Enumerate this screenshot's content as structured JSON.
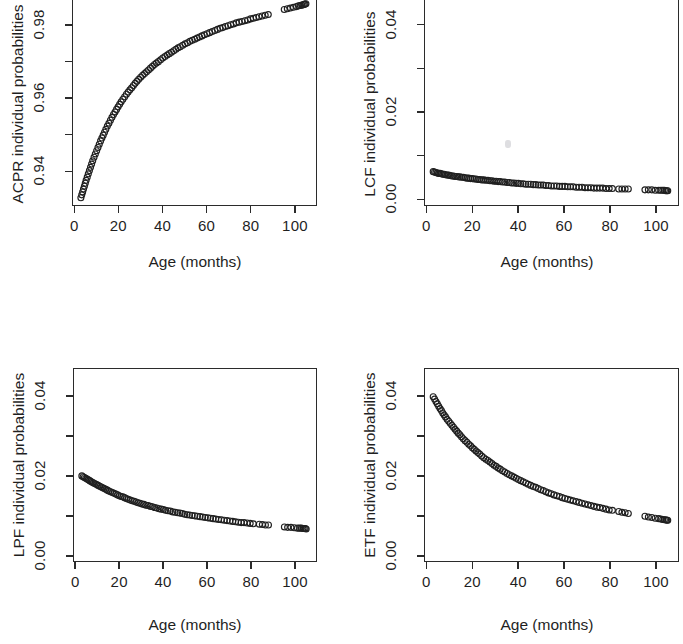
{
  "figure": {
    "layout": "2x2 grid of scatter plots",
    "background": "#ffffff",
    "marker_color": "#202020",
    "axis_color": "#2b2b2b"
  },
  "panels": [
    {
      "id": "acpr",
      "ylabel": "ACPR individual probabilities",
      "xlabel": "Age (months)",
      "ytick_labels": [
        "0.94",
        "0.96",
        "0.98"
      ],
      "xtick_labels": [
        "0",
        "20",
        "40",
        "60",
        "80",
        "100"
      ]
    },
    {
      "id": "lcf",
      "ylabel": "LCF individual probabilities",
      "xlabel": "Age (months)",
      "ytick_labels": [
        "0.00",
        "0.02",
        "0.04"
      ],
      "xtick_labels": [
        "0",
        "20",
        "40",
        "60",
        "80",
        "100"
      ]
    },
    {
      "id": "lpf",
      "ylabel": "LPF individual probabilities",
      "xlabel": "Age (months)",
      "ytick_labels": [
        "0.00",
        "0.02",
        "0.04"
      ],
      "xtick_labels": [
        "0",
        "20",
        "40",
        "60",
        "80",
        "100"
      ]
    },
    {
      "id": "etf",
      "ylabel": "ETF individual probabilities",
      "xlabel": "Age (months)",
      "ytick_labels": [
        "0.00",
        "0.02",
        "0.04"
      ],
      "xtick_labels": [
        "0",
        "20",
        "40",
        "60",
        "80",
        "100"
      ]
    }
  ],
  "chart_data": [
    {
      "type": "scatter",
      "title": "",
      "xlabel": "Age (months)",
      "ylabel": "ACPR individual probabilities",
      "xlim": [
        -1,
        110
      ],
      "ylim": [
        0.9305,
        0.9885
      ],
      "xticks": [
        0,
        20,
        40,
        60,
        80,
        100
      ],
      "yticks": [
        0.94,
        0.96,
        0.98
      ],
      "yticks_minor": [
        0.93,
        0.95,
        0.97,
        0.98
      ],
      "grid": false,
      "legend": false,
      "marker": "open-circle",
      "x": [
        2.6,
        3.0,
        3.4,
        3.8,
        4.2,
        4.6,
        5.0,
        5.5,
        6.0,
        6.5,
        7.0,
        7.5,
        8.0,
        8.6,
        9.2,
        9.8,
        10.4,
        11.0,
        11.6,
        12.2,
        12.8,
        13.4,
        14.0,
        14.7,
        15.4,
        16.1,
        16.8,
        17.5,
        18.2,
        18.9,
        19.6,
        20.3,
        21.0,
        21.8,
        22.6,
        23.4,
        24.2,
        25.0,
        25.8,
        26.6,
        27.4,
        28.2,
        29.0,
        29.9,
        30.8,
        31.7,
        32.6,
        33.5,
        34.4,
        35.3,
        36.2,
        37.1,
        38.0,
        39.0,
        40.0,
        41.0,
        42.0,
        43.0,
        44.0,
        45.0,
        46.0,
        47.0,
        48.0,
        49.1,
        50.2,
        51.3,
        52.4,
        53.5,
        54.6,
        55.7,
        56.8,
        57.9,
        59.0,
        60.2,
        61.4,
        62.6,
        63.8,
        65.0,
        66.2,
        67.4,
        68.6,
        69.8,
        71.0,
        72.3,
        73.6,
        74.9,
        76.2,
        77.5,
        78.8,
        80.1,
        81.4,
        82.7,
        84.0,
        85.4,
        86.8,
        88.2,
        95.5,
        96.9,
        98.3,
        99.7,
        101.1,
        102.0,
        102.8,
        103.5,
        104.1,
        104.6,
        105.0,
        105.4
      ],
      "y": [
        0.9325,
        0.9333,
        0.9341,
        0.9349,
        0.9357,
        0.9365,
        0.9373,
        0.9382,
        0.9391,
        0.94,
        0.9409,
        0.9418,
        0.9427,
        0.9437,
        0.9446,
        0.9455,
        0.9464,
        0.9473,
        0.9482,
        0.949,
        0.9498,
        0.9506,
        0.9514,
        0.9523,
        0.9531,
        0.9539,
        0.9547,
        0.9555,
        0.9562,
        0.9569,
        0.9576,
        0.9583,
        0.959,
        0.9597,
        0.9604,
        0.9611,
        0.9617,
        0.9623,
        0.9629,
        0.9635,
        0.9641,
        0.9647,
        0.9652,
        0.9658,
        0.9663,
        0.9668,
        0.9673,
        0.9678,
        0.9683,
        0.9688,
        0.9693,
        0.9697,
        0.9701,
        0.9706,
        0.9711,
        0.9715,
        0.9719,
        0.9723,
        0.9727,
        0.9731,
        0.9735,
        0.9739,
        0.9742,
        0.9746,
        0.975,
        0.9753,
        0.9757,
        0.976,
        0.9763,
        0.9766,
        0.9769,
        0.9772,
        0.9775,
        0.9778,
        0.9781,
        0.9784,
        0.9787,
        0.979,
        0.9793,
        0.9795,
        0.9798,
        0.98,
        0.9803,
        0.9805,
        0.9808,
        0.981,
        0.9812,
        0.9814,
        0.9816,
        0.9819,
        0.9821,
        0.9823,
        0.9825,
        0.9827,
        0.9829,
        0.9831,
        0.9845,
        0.9847,
        0.9849,
        0.9851,
        0.9853,
        0.9855,
        0.9856,
        0.9857,
        0.9858,
        0.9859,
        0.986,
        0.9861
      ]
    },
    {
      "type": "scatter",
      "title": "",
      "xlabel": "Age (months)",
      "ylabel": "LCF individual probabilities",
      "xlim": [
        -1,
        110
      ],
      "ylim": [
        -0.0015,
        0.047
      ],
      "xticks": [
        0,
        20,
        40,
        60,
        80,
        100
      ],
      "yticks": [
        0.0,
        0.02,
        0.04
      ],
      "yticks_minor": [
        0.01,
        0.03
      ],
      "grid": false,
      "legend": false,
      "marker": "open-circle",
      "x": [
        2.6,
        3.2,
        3.8,
        4.4,
        5.0,
        5.6,
        6.2,
        6.8,
        7.4,
        8.0,
        8.7,
        9.4,
        10.1,
        10.8,
        11.5,
        12.2,
        12.9,
        13.6,
        14.3,
        15.0,
        15.8,
        16.6,
        17.4,
        18.2,
        19.0,
        19.8,
        20.6,
        21.4,
        22.2,
        23.0,
        23.9,
        24.8,
        25.7,
        26.6,
        27.5,
        28.4,
        29.3,
        30.2,
        31.1,
        32.0,
        33.0,
        34.0,
        35.0,
        36.0,
        37.0,
        38.0,
        39.0,
        40.0,
        41.0,
        42.1,
        43.2,
        44.3,
        45.4,
        46.5,
        47.6,
        48.7,
        49.8,
        50.9,
        52.0,
        53.2,
        54.4,
        55.6,
        56.8,
        58.0,
        59.2,
        60.4,
        61.6,
        62.8,
        64.0,
        65.3,
        66.6,
        67.9,
        69.2,
        70.5,
        71.8,
        73.1,
        74.4,
        75.7,
        77.0,
        78.4,
        79.8,
        81.2,
        84.0,
        85.4,
        86.8,
        88.2,
        95.5,
        97.0,
        98.5,
        100.0,
        101.5,
        102.5,
        103.3,
        104.0,
        104.6,
        105.1,
        105.5
      ],
      "y": [
        0.0062,
        0.0061,
        0.006,
        0.0059,
        0.0058,
        0.0058,
        0.0057,
        0.0056,
        0.0056,
        0.0055,
        0.0054,
        0.0054,
        0.0053,
        0.0052,
        0.0052,
        0.0051,
        0.0051,
        0.005,
        0.005,
        0.0049,
        0.0049,
        0.0048,
        0.0047,
        0.0047,
        0.0046,
        0.0046,
        0.0045,
        0.0045,
        0.0044,
        0.0044,
        0.0043,
        0.0043,
        0.0042,
        0.0042,
        0.0041,
        0.0041,
        0.004,
        0.004,
        0.0039,
        0.0039,
        0.0038,
        0.0038,
        0.0037,
        0.0037,
        0.0036,
        0.0036,
        0.0035,
        0.0035,
        0.0034,
        0.0034,
        0.0033,
        0.0033,
        0.0033,
        0.0032,
        0.0032,
        0.0031,
        0.0031,
        0.0031,
        0.003,
        0.003,
        0.0029,
        0.0029,
        0.0029,
        0.0028,
        0.0028,
        0.0028,
        0.0027,
        0.0027,
        0.0027,
        0.0026,
        0.0026,
        0.0026,
        0.0025,
        0.0025,
        0.0025,
        0.0024,
        0.0024,
        0.0024,
        0.0024,
        0.0023,
        0.0023,
        0.0023,
        0.0022,
        0.0022,
        0.0022,
        0.0022,
        0.002,
        0.002,
        0.002,
        0.0019,
        0.0019,
        0.0019,
        0.0019,
        0.0019,
        0.0018,
        0.0018,
        0.0018
      ]
    },
    {
      "type": "scatter",
      "title": "",
      "xlabel": "Age (months)",
      "ylabel": "LPF individual probabilities",
      "xlim": [
        -1,
        110
      ],
      "ylim": [
        -0.0015,
        0.047
      ],
      "xticks": [
        0,
        20,
        40,
        60,
        80,
        100
      ],
      "yticks": [
        0.0,
        0.02,
        0.04
      ],
      "yticks_minor": [
        0.01,
        0.03
      ],
      "grid": false,
      "legend": false,
      "marker": "open-circle",
      "x": [
        2.6,
        3.2,
        3.8,
        4.4,
        5.0,
        5.6,
        6.2,
        6.8,
        7.4,
        8.0,
        8.7,
        9.4,
        10.1,
        10.8,
        11.5,
        12.2,
        12.9,
        13.6,
        14.3,
        15.0,
        15.8,
        16.6,
        17.4,
        18.2,
        19.0,
        19.8,
        20.6,
        21.4,
        22.2,
        23.0,
        23.9,
        24.8,
        25.7,
        26.6,
        27.5,
        28.4,
        29.3,
        30.2,
        31.1,
        32.0,
        33.0,
        34.0,
        35.0,
        36.0,
        37.0,
        38.0,
        39.0,
        40.0,
        41.0,
        42.1,
        43.2,
        44.3,
        45.4,
        46.5,
        47.6,
        48.7,
        49.8,
        50.9,
        52.0,
        53.2,
        54.4,
        55.6,
        56.8,
        58.0,
        59.2,
        60.4,
        61.6,
        62.8,
        64.0,
        65.3,
        66.6,
        67.9,
        69.2,
        70.5,
        71.8,
        73.1,
        74.4,
        75.7,
        77.0,
        78.4,
        79.8,
        81.2,
        84.0,
        85.4,
        86.8,
        88.2,
        95.5,
        97.0,
        98.5,
        100.0,
        101.5,
        102.5,
        103.3,
        104.0,
        104.6,
        105.1,
        105.5
      ],
      "y": [
        0.02,
        0.0198,
        0.0196,
        0.0194,
        0.0192,
        0.019,
        0.0188,
        0.0186,
        0.0184,
        0.0182,
        0.018,
        0.0178,
        0.0176,
        0.0174,
        0.0172,
        0.017,
        0.0168,
        0.0166,
        0.0164,
        0.0162,
        0.016,
        0.0158,
        0.0156,
        0.0154,
        0.0152,
        0.015,
        0.0148,
        0.0147,
        0.0145,
        0.0143,
        0.0141,
        0.0139,
        0.0137,
        0.0136,
        0.0134,
        0.0132,
        0.0131,
        0.0129,
        0.0128,
        0.0126,
        0.0125,
        0.0123,
        0.0122,
        0.012,
        0.0119,
        0.0117,
        0.0116,
        0.0115,
        0.0113,
        0.0112,
        0.0111,
        0.0109,
        0.0108,
        0.0107,
        0.0106,
        0.0105,
        0.0103,
        0.0102,
        0.0101,
        0.01,
        0.0099,
        0.0098,
        0.0097,
        0.0096,
        0.0095,
        0.0094,
        0.0093,
        0.0092,
        0.0091,
        0.009,
        0.0089,
        0.0088,
        0.0087,
        0.0086,
        0.0085,
        0.0084,
        0.0083,
        0.0082,
        0.0082,
        0.0081,
        0.008,
        0.0079,
        0.0078,
        0.0077,
        0.0076,
        0.0076,
        0.0071,
        0.007,
        0.007,
        0.0069,
        0.0068,
        0.0068,
        0.0068,
        0.0067,
        0.0067,
        0.0067,
        0.0066
      ]
    },
    {
      "type": "scatter",
      "title": "",
      "xlabel": "Age (months)",
      "ylabel": "ETF individual probabilities",
      "xlim": [
        -1,
        110
      ],
      "ylim": [
        -0.0015,
        0.047
      ],
      "xticks": [
        0,
        20,
        40,
        60,
        80,
        100
      ],
      "yticks": [
        0.0,
        0.02,
        0.04
      ],
      "yticks_minor": [
        0.01,
        0.03
      ],
      "grid": false,
      "legend": false,
      "marker": "open-circle",
      "x": [
        2.6,
        3.2,
        3.8,
        4.4,
        5.0,
        5.6,
        6.2,
        6.8,
        7.4,
        8.0,
        8.7,
        9.4,
        10.1,
        10.8,
        11.5,
        12.2,
        12.9,
        13.6,
        14.3,
        15.0,
        15.8,
        16.6,
        17.4,
        18.2,
        19.0,
        19.8,
        20.6,
        21.4,
        22.2,
        23.0,
        23.9,
        24.8,
        25.7,
        26.6,
        27.5,
        28.4,
        29.3,
        30.2,
        31.1,
        32.0,
        33.0,
        34.0,
        35.0,
        36.0,
        37.0,
        38.0,
        39.0,
        40.0,
        41.0,
        42.1,
        43.2,
        44.3,
        45.4,
        46.5,
        47.6,
        48.7,
        49.8,
        50.9,
        52.0,
        53.2,
        54.4,
        55.6,
        56.8,
        58.0,
        59.2,
        60.4,
        61.6,
        62.8,
        64.0,
        65.3,
        66.6,
        67.9,
        69.2,
        70.5,
        71.8,
        73.1,
        74.4,
        75.7,
        77.0,
        78.4,
        79.8,
        81.2,
        84.0,
        85.4,
        86.8,
        88.2,
        95.5,
        97.0,
        98.5,
        100.0,
        101.5,
        102.5,
        103.3,
        104.0,
        104.6,
        105.1,
        105.5
      ],
      "y": [
        0.04,
        0.0394,
        0.0388,
        0.0382,
        0.0376,
        0.037,
        0.0365,
        0.0359,
        0.0354,
        0.0349,
        0.0343,
        0.0338,
        0.0333,
        0.0328,
        0.0323,
        0.0318,
        0.0313,
        0.0308,
        0.0304,
        0.0299,
        0.0294,
        0.0289,
        0.0285,
        0.028,
        0.0276,
        0.0271,
        0.0267,
        0.0263,
        0.0259,
        0.0255,
        0.025,
        0.0246,
        0.0242,
        0.0239,
        0.0235,
        0.0231,
        0.0227,
        0.0224,
        0.022,
        0.0217,
        0.0213,
        0.021,
        0.0206,
        0.0203,
        0.02,
        0.0197,
        0.0194,
        0.0191,
        0.0188,
        0.0185,
        0.0182,
        0.0179,
        0.0176,
        0.0173,
        0.0171,
        0.0168,
        0.0165,
        0.0163,
        0.016,
        0.0157,
        0.0155,
        0.0152,
        0.015,
        0.0148,
        0.0145,
        0.0143,
        0.0141,
        0.0139,
        0.0137,
        0.0135,
        0.0133,
        0.0131,
        0.0129,
        0.0127,
        0.0125,
        0.0123,
        0.0121,
        0.012,
        0.0118,
        0.0116,
        0.0114,
        0.0113,
        0.011,
        0.0108,
        0.0107,
        0.0105,
        0.0098,
        0.0096,
        0.0095,
        0.0093,
        0.0092,
        0.0091,
        0.009,
        0.0089,
        0.0089,
        0.0088,
        0.0088
      ]
    }
  ]
}
